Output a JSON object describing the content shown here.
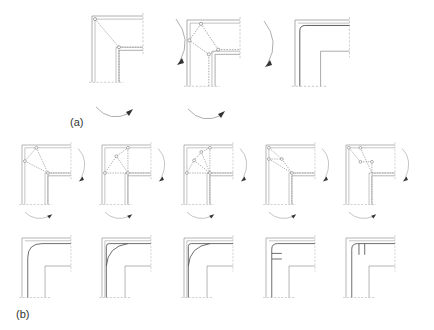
{
  "figure": {
    "label_a": "(a)",
    "label_b": "(b)"
  },
  "panels": {
    "a": [
      {
        "id": "a1",
        "kind": "strut-tie",
        "nodes": 2
      },
      {
        "id": "a2",
        "kind": "strut-tie",
        "nodes": 4
      },
      {
        "id": "a3",
        "kind": "reinforcement",
        "detail": "bent-bar"
      }
    ],
    "b_top": [
      {
        "id": "b1",
        "kind": "strut-tie",
        "nodes": 3
      },
      {
        "id": "b2",
        "kind": "strut-tie",
        "nodes": 4
      },
      {
        "id": "b3",
        "kind": "strut-tie",
        "nodes": 5
      },
      {
        "id": "b4",
        "kind": "strut-tie",
        "nodes": 5
      },
      {
        "id": "b5",
        "kind": "strut-tie",
        "nodes": 4
      }
    ],
    "b_bottom": [
      {
        "id": "b1r",
        "kind": "reinforcement",
        "detail": "large-radius-bend"
      },
      {
        "id": "b2r",
        "kind": "reinforcement",
        "detail": "bend-with-inner-curve"
      },
      {
        "id": "b3r",
        "kind": "reinforcement",
        "detail": "bend-with-inner-curve"
      },
      {
        "id": "b4r",
        "kind": "reinforcement",
        "detail": "horizontal-stirrups"
      },
      {
        "id": "b5r",
        "kind": "reinforcement",
        "detail": "vertical-stirrups"
      }
    ]
  }
}
